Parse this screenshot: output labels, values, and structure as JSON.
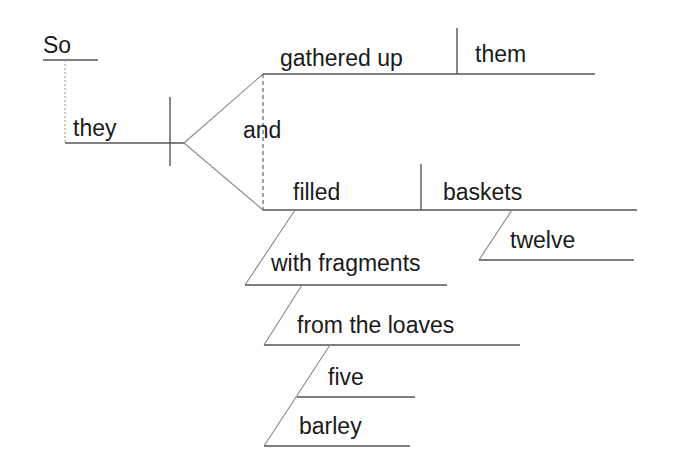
{
  "diagram": {
    "type": "Reed-Kellogg sentence diagram",
    "sentence": "So they gathered up them and filled twelve baskets with fragments from the five barley loaves",
    "words": {
      "conjunction_adverb": "So",
      "subject": "they",
      "conjunction": "and",
      "verb1": "gathered up",
      "object1": "them",
      "verb2": "filled",
      "object2": "baskets",
      "modifier_object2": "twelve",
      "prep_phrase1": "with fragments",
      "prep_phrase2": "from the loaves",
      "modifier_loaves1": "five",
      "modifier_loaves2": "barley"
    },
    "colors": {
      "text": "#1a1a1a",
      "line": "#555555",
      "background": "#ffffff"
    }
  }
}
